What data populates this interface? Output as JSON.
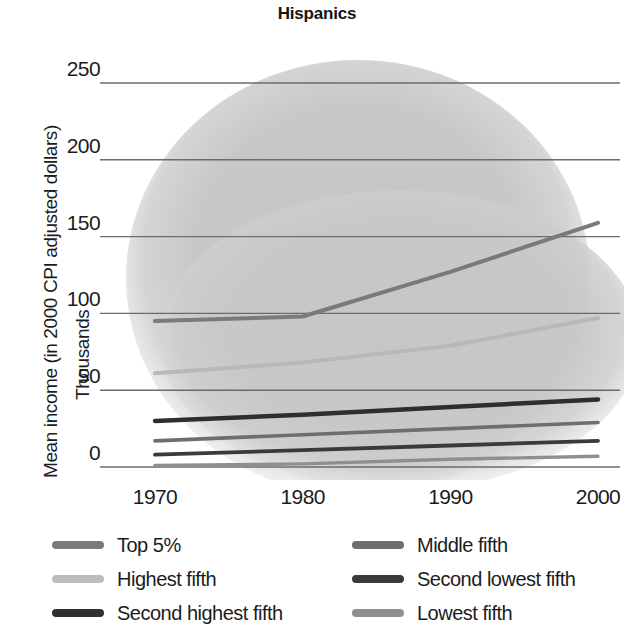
{
  "chart_data": {
    "type": "line",
    "title": "Hispanics",
    "xlabel": "",
    "ylabel": "Mean income (in 2000 CPI adjusted dollars)",
    "ylabel_line2": "Thousands",
    "x": [
      1970,
      1980,
      1990,
      2000
    ],
    "xtick_labels": [
      "1970",
      "1980",
      "1990",
      "2000"
    ],
    "ytick_labels": [
      "0",
      "50",
      "100",
      "150",
      "200",
      "250"
    ],
    "yticks": [
      0,
      50,
      100,
      150,
      200,
      250
    ],
    "ylim": [
      0,
      265
    ],
    "xlim": [
      1968,
      2002
    ],
    "grid": "horizontal",
    "legend_position": "below-plot",
    "series": [
      {
        "name": "Top 5%",
        "values": [
          95,
          98,
          127,
          159
        ],
        "color": "#7a7a7a",
        "width": 4.0
      },
      {
        "name": "Highest fifth",
        "values": [
          61,
          68,
          79,
          97
        ],
        "color": "#b8b8b8",
        "width": 4.0
      },
      {
        "name": "Second highest fifth",
        "values": [
          30,
          34,
          39,
          44
        ],
        "color": "#2e2e2e",
        "width": 4.5
      },
      {
        "name": "Middle fifth",
        "values": [
          17,
          21,
          25,
          29
        ],
        "color": "#6e6e6e",
        "width": 3.6
      },
      {
        "name": "Second lowest fifth",
        "values": [
          8,
          11,
          14,
          17
        ],
        "color": "#3a3a3a",
        "width": 3.8
      },
      {
        "name": "Lowest fifth",
        "values": [
          1,
          2,
          5,
          7
        ],
        "color": "#8f8f8f",
        "width": 3.4
      }
    ]
  },
  "legend": {
    "columns": [
      {
        "items": [
          {
            "label": "Top 5%",
            "color": "#7a7a7a"
          },
          {
            "label": "Highest fifth",
            "color": "#bdbdbd"
          },
          {
            "label": "Second highest fifth",
            "color": "#303030"
          }
        ]
      },
      {
        "items": [
          {
            "label": "Middle fifth",
            "color": "#6e6e6e"
          },
          {
            "label": "Second lowest fifth",
            "color": "#3a3a3a"
          },
          {
            "label": "Lowest fifth",
            "color": "#8f8f8f"
          }
        ]
      }
    ]
  },
  "style": {
    "gridline_color": "#6b6b6b",
    "background_blob_color": "#c9c9c9",
    "text_color": "#1c1c1c"
  }
}
